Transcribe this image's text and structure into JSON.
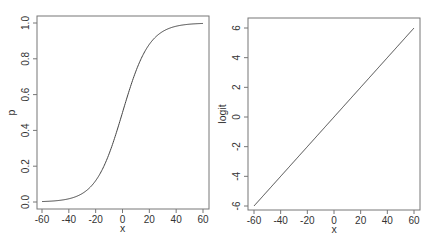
{
  "chart_data": [
    {
      "type": "line",
      "title": "",
      "xlabel": "x",
      "ylabel": "p",
      "xlim": [
        -64,
        64
      ],
      "ylim": [
        -0.04,
        1.04
      ],
      "xticks": [
        "-60",
        "-40",
        "-20",
        "0",
        "20",
        "40",
        "60"
      ],
      "yticks": [
        "0.0",
        "0.2",
        "0.4",
        "0.6",
        "0.8",
        "1.0"
      ],
      "grid": false,
      "legend": null,
      "series": [
        {
          "name": "p = 1/(1+exp(-0.1x))",
          "x": [
            -60,
            -50,
            -40,
            -30,
            -20,
            -10,
            0,
            10,
            20,
            30,
            40,
            50,
            60
          ],
          "values": [
            0.002,
            0.007,
            0.018,
            0.047,
            0.119,
            0.269,
            0.5,
            0.731,
            0.881,
            0.953,
            0.982,
            0.993,
            0.998
          ]
        }
      ]
    },
    {
      "type": "line",
      "title": "",
      "xlabel": "x",
      "ylabel": "logit",
      "xlim": [
        -64,
        64
      ],
      "ylim": [
        -6.2,
        6.6
      ],
      "xticks": [
        "-60",
        "-40",
        "-20",
        "0",
        "20",
        "40",
        "60"
      ],
      "yticks": [
        "-6",
        "-4",
        "-2",
        "0",
        "2",
        "4",
        "6"
      ],
      "grid": false,
      "legend": null,
      "series": [
        {
          "name": "logit = 0.1x",
          "x": [
            -60,
            -40,
            -20,
            0,
            20,
            40,
            60
          ],
          "values": [
            -6,
            -4,
            -2,
            0,
            2,
            4,
            6
          ]
        }
      ]
    }
  ],
  "left": {
    "xlabel": "x",
    "ylabel": "p"
  },
  "right": {
    "xlabel": "x",
    "ylabel": "logit"
  }
}
